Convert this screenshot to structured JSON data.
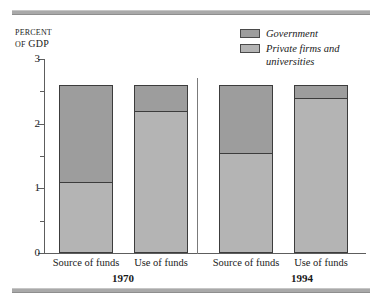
{
  "axis_title": {
    "line1": "Percent",
    "line2_prefix": "of",
    "line2_rest": "GDP"
  },
  "legend": {
    "items": [
      {
        "label": "Government",
        "key": "government",
        "color": "#9d9d9d"
      },
      {
        "label": "Private firms and\nuniversities",
        "key": "private",
        "color": "#b4b4b4"
      }
    ]
  },
  "chart_data": {
    "type": "bar",
    "title": "",
    "xlabel": "",
    "ylabel": "Percent of GDP",
    "ylim": [
      0,
      3
    ],
    "ytick_labels": [
      "0",
      "1",
      "2",
      "3"
    ],
    "ytick_values": [
      0,
      1,
      2,
      3
    ],
    "yminor_values": [
      0.5,
      1.5,
      2.5
    ],
    "grid": false,
    "legend_position": "top-right",
    "stacked": true,
    "groups": [
      "1970",
      "1994"
    ],
    "categories": [
      "Source of funds",
      "Use of funds",
      "Source of funds",
      "Use of funds"
    ],
    "series": [
      {
        "name": "Private firms and universities",
        "values": [
          1.1,
          2.2,
          1.55,
          2.4
        ]
      },
      {
        "name": "Government",
        "values": [
          1.5,
          0.4,
          1.05,
          0.2
        ]
      }
    ],
    "totals": [
      2.6,
      2.6,
      2.6,
      2.6
    ]
  },
  "ticks": [
    {
      "label": "3",
      "value": 3,
      "major": true
    },
    {
      "label": "",
      "value": 2.5,
      "major": false
    },
    {
      "label": "2",
      "value": 2,
      "major": true
    },
    {
      "label": "",
      "value": 1.5,
      "major": false
    },
    {
      "label": "1",
      "value": 1,
      "major": true
    },
    {
      "label": "",
      "value": 0.5,
      "major": false
    },
    {
      "label": "0",
      "value": 0,
      "major": true
    }
  ],
  "bars": [
    {
      "category": "Source of funds",
      "group": "1970",
      "private": 1.1,
      "total": 2.6
    },
    {
      "category": "Use of funds",
      "group": "1970",
      "private": 2.2,
      "total": 2.6
    },
    {
      "category": "Source of funds",
      "group": "1994",
      "private": 1.55,
      "total": 2.6
    },
    {
      "category": "Use of funds",
      "group": "1994",
      "private": 2.4,
      "total": 2.6
    }
  ],
  "group_labels": [
    "1970",
    "1994"
  ]
}
